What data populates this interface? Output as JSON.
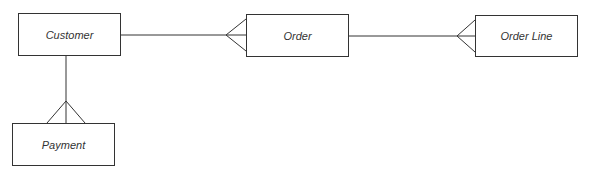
{
  "diagram": {
    "type": "entity-relationship",
    "entities": [
      {
        "id": "customer",
        "label": "Customer"
      },
      {
        "id": "order",
        "label": "Order"
      },
      {
        "id": "order_line",
        "label": "Order Line"
      },
      {
        "id": "payment",
        "label": "Payment"
      }
    ],
    "relationships": [
      {
        "from": "Customer",
        "to": "Order",
        "cardinality": "one-to-many"
      },
      {
        "from": "Order",
        "to": "Order Line",
        "cardinality": "one-to-many"
      },
      {
        "from": "Customer",
        "to": "Payment",
        "cardinality": "one-to-many"
      }
    ],
    "colors": {
      "line": "#333333",
      "background": "#ffffff"
    }
  }
}
